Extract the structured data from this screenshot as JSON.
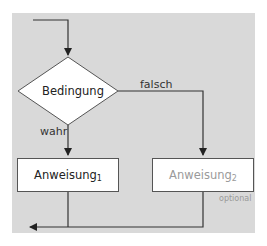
{
  "diagram": {
    "type": "flowchart-if-else",
    "decision": {
      "label": "Bedingung"
    },
    "branches": {
      "true_label": "wahr",
      "false_label": "falsch"
    },
    "statement1": {
      "label": "Anweisung",
      "subscript": "1"
    },
    "statement2": {
      "label": "Anweisung",
      "subscript": "2",
      "note": "optional"
    },
    "colors": {
      "background": "#d9d9d9",
      "lines": "#333333",
      "box_fill": "#ffffff",
      "muted_text": "#9a9a9a"
    }
  }
}
